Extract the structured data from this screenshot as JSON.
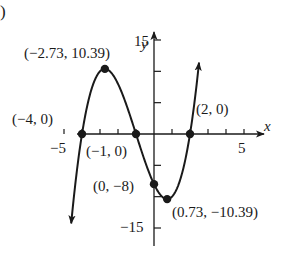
{
  "panel_label": ")",
  "chart_data": {
    "type": "line",
    "title": "",
    "function": "f(x) = (x + 4)(x + 1)(x - 2)",
    "xlabel": "x",
    "ylabel": "y",
    "xlim": [
      -5,
      5
    ],
    "ylim": [
      -15,
      15
    ],
    "x_tick_step": 1,
    "y_tick_step": 5,
    "x_tick_labels": [
      "-5",
      "5"
    ],
    "y_tick_labels": [
      "15",
      "-15"
    ],
    "grid": false,
    "arrows": [
      "curve-left-end-down",
      "curve-right-end-up",
      "x-axis-positive",
      "y-axis-positive"
    ],
    "points": [
      {
        "x": -4,
        "y": 0,
        "label": "(−4, 0)"
      },
      {
        "x": -2.73,
        "y": 10.39,
        "label": "(−2.73, 10.39)"
      },
      {
        "x": -1,
        "y": 0,
        "label": "(−1, 0)"
      },
      {
        "x": 0,
        "y": -8,
        "label": "(0, −8)"
      },
      {
        "x": 0.73,
        "y": -10.39,
        "label": "(0.73, −10.39)"
      },
      {
        "x": 2,
        "y": 0,
        "label": "(2, 0)"
      }
    ],
    "curve_domain": [
      -4.6,
      2.5
    ]
  },
  "colors": {
    "ink": "#1a1a1a",
    "background": "#ffffff"
  }
}
